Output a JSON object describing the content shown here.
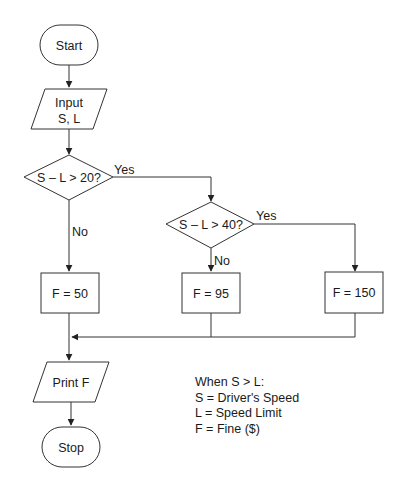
{
  "diagram": {
    "type": "flowchart",
    "nodes": {
      "start": {
        "shape": "terminal",
        "label": "Start"
      },
      "input": {
        "shape": "parallelogram",
        "label_line1": "Input",
        "label_line2": "S, L"
      },
      "decision1": {
        "shape": "diamond",
        "label": "S – L > 20?"
      },
      "decision2": {
        "shape": "diamond",
        "label": "S – L > 40?"
      },
      "fine50": {
        "shape": "process",
        "label": "F = 50"
      },
      "fine95": {
        "shape": "process",
        "label": "F = 95"
      },
      "fine150": {
        "shape": "process",
        "label": "F = 150"
      },
      "print": {
        "shape": "parallelogram",
        "label": "Print F"
      },
      "stop": {
        "shape": "terminal",
        "label": "Stop"
      }
    },
    "edges": {
      "d1_yes": "Yes",
      "d1_no": "No",
      "d2_yes": "Yes",
      "d2_no": "No"
    },
    "legend": {
      "title": "When S > L:",
      "items": [
        "S = Driver's Speed",
        "L = Speed Limit",
        "F = Fine ($)"
      ]
    },
    "colors": {
      "stroke": "#333333",
      "text": "#1a1a1a",
      "background": "#ffffff"
    }
  }
}
